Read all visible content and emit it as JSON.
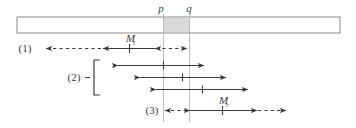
{
  "figure": {
    "colors": {
      "stroke": "#3a3a3a",
      "bar_outline": "#8a8a8a",
      "shaded_region": "#d9d9d9",
      "guide_line": "#b3b3b3",
      "background": "#ffffff"
    },
    "axis_labels": {
      "p": "p",
      "q": "q"
    },
    "row_labels": {
      "row1": "(1)",
      "row2": "(2)",
      "row3": "(3)"
    },
    "measure_labels": {
      "left": "M",
      "left_sub": "l",
      "right": "M",
      "right_sub": "r"
    },
    "geometry": {
      "bar": {
        "x": 17,
        "y": 17,
        "width": 323,
        "height": 16
      },
      "shaded": {
        "x": 163,
        "y": 18,
        "width": 26,
        "height": 14
      },
      "p_line_x": 163,
      "q_line_x": 189,
      "guides_top": 17,
      "guides_bottom": 122
    },
    "rows": [
      {
        "name": "row-1",
        "y": 48,
        "label": "(1)",
        "label_x": 25,
        "dashed_left": {
          "from": 155,
          "to": 103
        },
        "solid": {
          "from": 103,
          "to": 155,
          "tick": 129
        },
        "dashed_right": {
          "from": 155,
          "to": 189
        }
      },
      {
        "name": "row-2-arrow-a",
        "y": 65,
        "solid": {
          "from": 118,
          "to": 204,
          "tick": 163
        }
      },
      {
        "name": "row-2-arrow-b",
        "y": 77,
        "solid": {
          "from": 140,
          "to": 225,
          "tick": 182
        }
      },
      {
        "name": "row-2-arrow-c",
        "y": 89,
        "solid": {
          "from": 155,
          "to": 247,
          "tick": 202
        }
      },
      {
        "name": "row-3",
        "y": 110,
        "label": "(3)",
        "label_x": 152,
        "dashed_left": {
          "from": 189,
          "to": 163
        },
        "solid": {
          "from": 189,
          "to": 258,
          "tick": 222
        },
        "dashed_right": {
          "from": 258,
          "to": 286
        }
      }
    ],
    "brace": {
      "label": "(2)",
      "label_x": 74,
      "label_y": 78,
      "dash_x": 86,
      "bracket_x": 94,
      "bracket_top": 60,
      "bracket_bottom": 95
    }
  }
}
